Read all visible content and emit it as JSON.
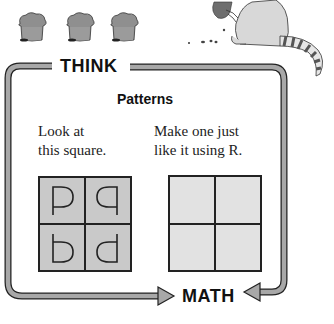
{
  "header": {
    "muffins": [
      {
        "name": "muffin-1"
      },
      {
        "name": "muffin-2"
      },
      {
        "name": "muffin-3"
      }
    ],
    "mascot": "raccoon-eating-muffin"
  },
  "frame": {
    "top_label": "THINK",
    "bottom_label": "MATH"
  },
  "content": {
    "title": "Patterns",
    "left_instruction_line1": "Look at",
    "left_instruction_line2": "this square.",
    "right_instruction_line1": "Make one just",
    "right_instruction_line2": "like it using R.",
    "example_square": {
      "cells": [
        {
          "glyph": "P",
          "transform": "mirrored",
          "note": "D-shaped bowl right, stem left down"
        },
        {
          "glyph": "q",
          "transform": "mirrored"
        },
        {
          "glyph": "b",
          "transform": "normal"
        },
        {
          "glyph": "d",
          "transform": "normal"
        }
      ],
      "fill_color": "#c9c9c9"
    },
    "answer_square": {
      "cells": [
        "",
        "",
        "",
        ""
      ],
      "fill_color": "#e2e2e2"
    }
  },
  "colors": {
    "frame_gray": "#a8a8a8",
    "outline": "#222222",
    "text": "#111111"
  }
}
